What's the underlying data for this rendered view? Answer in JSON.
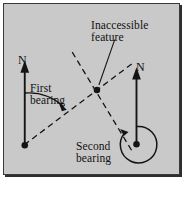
{
  "figure": {
    "kind": "survey-intersection-diagram",
    "background_color": "#c9c9c9",
    "page_color": "#ffffff",
    "border_color": "#3a3a3a",
    "ink_color": "#111111",
    "labels": {
      "north_left": "N",
      "north_right": "N",
      "first_bearing": "First\nbearing",
      "second_bearing": "Second\nbearing",
      "inaccessible_feature": "Inaccessible\nfeature"
    },
    "points": {
      "station_left": {
        "name": "station-left",
        "x": 24,
        "y": 146
      },
      "station_right": {
        "name": "station-right",
        "x": 137,
        "y": 145
      },
      "feature": {
        "name": "inaccessible-feature-point",
        "x": 97,
        "y": 90
      }
    },
    "north_arrows": [
      {
        "name": "north-arrow-left",
        "x": 24,
        "y_tail": 146,
        "y_head": 63
      },
      {
        "name": "north-arrow-right",
        "x": 137,
        "y_tail": 145,
        "y_head": 70
      }
    ],
    "sight_lines": [
      {
        "name": "first-bearing-line",
        "from": "station_left",
        "through": "feature",
        "style": "dashed"
      },
      {
        "name": "second-bearing-line",
        "from": "station_right",
        "through": "feature",
        "style": "dashed"
      }
    ],
    "angle_arcs": [
      {
        "name": "first-bearing-arc",
        "center": "station_left",
        "from_deg": 0,
        "to_deg": 63,
        "radius": 52
      },
      {
        "name": "second-bearing-arc",
        "center": "station_right",
        "from_deg": 0,
        "to_deg": 315,
        "radius": 18
      }
    ],
    "leader_lines": [
      {
        "name": "feature-leader",
        "from_label": "inaccessible_feature",
        "to_point": "feature"
      }
    ]
  }
}
